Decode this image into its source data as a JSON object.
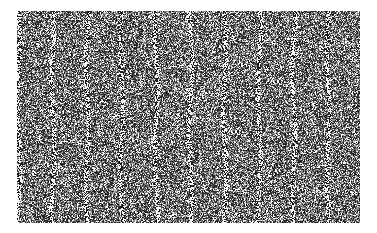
{
  "image": {
    "description": "Grayscale random noise field with faint periodic vertical streaks",
    "canvas": {
      "width": 377,
      "height": 233,
      "background": "#ffffff"
    },
    "field": {
      "x": 17,
      "y": 11,
      "width": 343,
      "height": 212
    },
    "streaks": {
      "count": 10,
      "start_x": 1,
      "spacing": 34.4
    },
    "colors": {
      "dark": "#1a1a1a",
      "mid": "#7a7a7a",
      "light": "#f0f0f0"
    }
  }
}
